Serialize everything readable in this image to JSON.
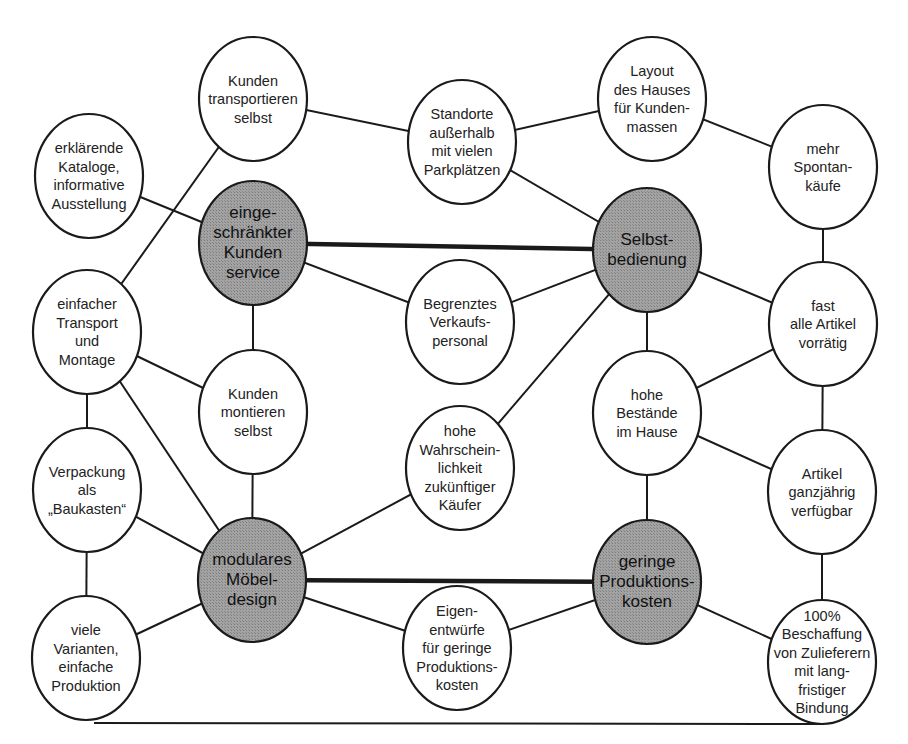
{
  "diagram": {
    "type": "concept-network",
    "colors": {
      "core_fill": "#9a9a9a",
      "plain_fill": "#ffffff",
      "stroke": "#1a1a1a"
    },
    "nodes": [
      {
        "id": "kunden_transportieren",
        "kind": "plain",
        "lines": [
          "Kunden",
          "transportieren",
          "selbst"
        ]
      },
      {
        "id": "erklaerende_kataloge",
        "kind": "plain",
        "lines": [
          "erklärende",
          "Kataloge,",
          "informative",
          "Ausstellung"
        ]
      },
      {
        "id": "standorte",
        "kind": "plain",
        "lines": [
          "Standorte",
          "außerhalb",
          "mit vielen",
          "Parkplätzen"
        ]
      },
      {
        "id": "layout",
        "kind": "plain",
        "lines": [
          "Layout",
          "des Hauses",
          "für Kunden-",
          "massen"
        ]
      },
      {
        "id": "spontankaeufe",
        "kind": "plain",
        "lines": [
          "mehr",
          "Spontan-",
          "käufe"
        ]
      },
      {
        "id": "kundenservice",
        "kind": "core",
        "lines": [
          "einge-",
          "schränkter",
          "Kunden",
          "service"
        ]
      },
      {
        "id": "selbstbedienung",
        "kind": "core",
        "lines": [
          "Selbst-",
          "bedienung"
        ]
      },
      {
        "id": "einfacher_transport",
        "kind": "plain",
        "lines": [
          "einfacher",
          "Transport",
          "und",
          "Montage"
        ]
      },
      {
        "id": "verkaufspersonal",
        "kind": "plain",
        "lines": [
          "Begrenztes",
          "Verkaufs-",
          "personal"
        ]
      },
      {
        "id": "artikel_vorraetig",
        "kind": "plain",
        "lines": [
          "fast",
          "alle Artikel",
          "vorrätig"
        ]
      },
      {
        "id": "kunden_montieren",
        "kind": "plain",
        "lines": [
          "Kunden",
          "montieren",
          "selbst"
        ]
      },
      {
        "id": "wahrscheinlichkeit",
        "kind": "plain",
        "lines": [
          "hohe",
          "Wahrschein-",
          "lichkeit",
          "zukünftiger",
          "Käufer"
        ]
      },
      {
        "id": "bestaende",
        "kind": "plain",
        "lines": [
          "hohe",
          "Bestände",
          "im Hause"
        ]
      },
      {
        "id": "verpackung",
        "kind": "plain",
        "lines": [
          "Verpackung",
          "als",
          "„Baukasten“"
        ]
      },
      {
        "id": "ganzjaehrig",
        "kind": "plain",
        "lines": [
          "Artikel",
          "ganzjährig",
          "verfügbar"
        ]
      },
      {
        "id": "moebeldesign",
        "kind": "core",
        "lines": [
          "modulares",
          "Möbel-",
          "design"
        ]
      },
      {
        "id": "produktionskosten",
        "kind": "core",
        "lines": [
          "geringe",
          "Produktions-",
          "kosten"
        ]
      },
      {
        "id": "varianten",
        "kind": "plain",
        "lines": [
          "viele",
          "Varianten,",
          "einfache",
          "Produktion"
        ]
      },
      {
        "id": "eigenentwuerfe",
        "kind": "plain",
        "lines": [
          "Eigen-",
          "entwürfe",
          "für geringe",
          "Produktions-",
          "kosten"
        ]
      },
      {
        "id": "beschaffung",
        "kind": "plain",
        "lines": [
          "100%",
          "Beschaffung",
          "von Zulieferern",
          "mit lang-",
          "fristiger",
          "Bindung"
        ]
      }
    ],
    "edges": [
      {
        "from": "kunden_transportieren",
        "to": "standorte",
        "weight": "normal"
      },
      {
        "from": "kunden_transportieren",
        "to": "einfacher_transport",
        "weight": "normal"
      },
      {
        "from": "erklaerende_kataloge",
        "to": "kundenservice",
        "weight": "normal"
      },
      {
        "from": "standorte",
        "to": "layout",
        "weight": "normal"
      },
      {
        "from": "standorte",
        "to": "selbstbedienung",
        "weight": "normal"
      },
      {
        "from": "layout",
        "to": "spontankaeufe",
        "weight": "normal"
      },
      {
        "from": "spontankaeufe",
        "to": "artikel_vorraetig",
        "weight": "normal"
      },
      {
        "from": "kundenservice",
        "to": "selbstbedienung",
        "weight": "strong"
      },
      {
        "from": "kundenservice",
        "to": "verkaufspersonal",
        "weight": "normal"
      },
      {
        "from": "kundenservice",
        "to": "kunden_montieren",
        "weight": "normal"
      },
      {
        "from": "selbstbedienung",
        "to": "verkaufspersonal",
        "weight": "normal"
      },
      {
        "from": "selbstbedienung",
        "to": "wahrscheinlichkeit",
        "weight": "normal"
      },
      {
        "from": "selbstbedienung",
        "to": "bestaende",
        "weight": "normal"
      },
      {
        "from": "selbstbedienung",
        "to": "artikel_vorraetig",
        "weight": "normal"
      },
      {
        "from": "einfacher_transport",
        "to": "kunden_montieren",
        "weight": "normal"
      },
      {
        "from": "einfacher_transport",
        "to": "verpackung",
        "weight": "normal"
      },
      {
        "from": "einfacher_transport",
        "to": "moebeldesign",
        "weight": "normal"
      },
      {
        "from": "kunden_montieren",
        "to": "moebeldesign",
        "weight": "normal"
      },
      {
        "from": "wahrscheinlichkeit",
        "to": "moebeldesign",
        "weight": "normal"
      },
      {
        "from": "bestaende",
        "to": "artikel_vorraetig",
        "weight": "normal"
      },
      {
        "from": "bestaende",
        "to": "ganzjaehrig",
        "weight": "normal"
      },
      {
        "from": "bestaende",
        "to": "produktionskosten",
        "weight": "normal"
      },
      {
        "from": "artikel_vorraetig",
        "to": "ganzjaehrig",
        "weight": "normal"
      },
      {
        "from": "verpackung",
        "to": "moebeldesign",
        "weight": "normal"
      },
      {
        "from": "verpackung",
        "to": "varianten",
        "weight": "normal"
      },
      {
        "from": "ganzjaehrig",
        "to": "beschaffung",
        "weight": "normal"
      },
      {
        "from": "moebeldesign",
        "to": "produktionskosten",
        "weight": "strong"
      },
      {
        "from": "moebeldesign",
        "to": "varianten",
        "weight": "normal"
      },
      {
        "from": "moebeldesign",
        "to": "eigenentwuerfe",
        "weight": "normal"
      },
      {
        "from": "produktionskosten",
        "to": "eigenentwuerfe",
        "weight": "normal"
      },
      {
        "from": "produktionskosten",
        "to": "beschaffung",
        "weight": "normal"
      },
      {
        "from": "varianten",
        "to": "beschaffung",
        "weight": "normal",
        "route": "bottom"
      }
    ]
  }
}
